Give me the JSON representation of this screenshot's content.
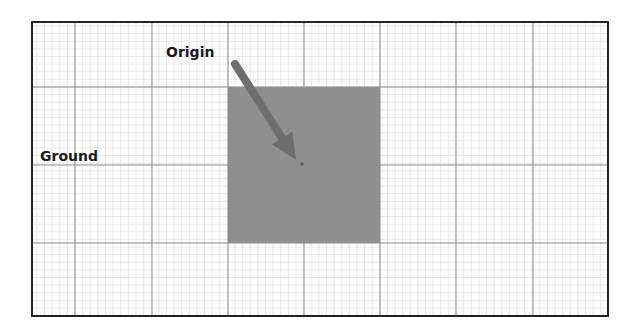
{
  "diagram": {
    "labels": {
      "origin": "Origin",
      "ground": "Ground"
    },
    "frame": {
      "x": 32,
      "y": 22,
      "width": 576,
      "height": 294,
      "stroke": "#222222"
    },
    "grid": {
      "minor_step": 7.62,
      "major_step": 76.2,
      "minor_color": "#d8d8d8",
      "major_color": "#8a8a8a",
      "major_x": [
        75,
        152,
        228,
        304,
        380,
        456,
        533
      ],
      "major_y": [
        87,
        165,
        243
      ]
    },
    "square": {
      "x": 228,
      "y": 87,
      "width": 152,
      "height": 156,
      "fill": "#8f8f8f"
    },
    "arrow": {
      "from": [
        235,
        64
      ],
      "to": [
        296,
        160
      ],
      "color": "#6e6e6e"
    },
    "origin_point": {
      "x": 302,
      "y": 164
    }
  }
}
